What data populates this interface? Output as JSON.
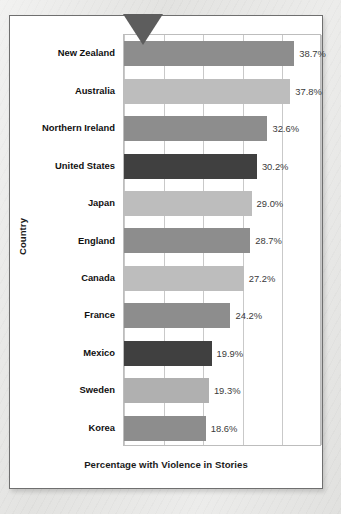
{
  "figure": {
    "pointer_icon": "down-triangle-pointer-icon"
  },
  "chart_data": {
    "type": "bar",
    "orientation": "horizontal",
    "title": "",
    "xlabel": "Percentage with Violence in Stories",
    "ylabel": "Country",
    "categories": [
      "New Zealand",
      "Australia",
      "Northern Ireland",
      "United States",
      "Japan",
      "England",
      "Canada",
      "France",
      "Mexico",
      "Sweden",
      "Korea"
    ],
    "values": [
      38.7,
      37.8,
      32.6,
      30.2,
      29.0,
      28.7,
      27.2,
      24.2,
      19.9,
      19.3,
      18.6
    ],
    "value_labels": [
      "38.7%",
      "37.8%",
      "32.6%",
      "30.2%",
      "29.0%",
      "28.7%",
      "27.2%",
      "24.2%",
      "19.9%",
      "19.3%",
      "18.6%"
    ],
    "bar_colors": [
      "#8d8d8d",
      "#bdbdbd",
      "#8d8d8d",
      "#404040",
      "#bdbdbd",
      "#8d8d8d",
      "#bdbdbd",
      "#8d8d8d",
      "#404040",
      "#b0b0b0",
      "#8d8d8d"
    ],
    "xlim": [
      0,
      45
    ],
    "x_gridline_values": [
      0,
      9,
      18,
      27,
      36,
      45
    ],
    "x_tick_labels": [],
    "grid": true,
    "legend": "none"
  },
  "colors": {
    "page_background": "#e2e2e0",
    "card_background": "#ffffff",
    "card_border": "#6f6f6f",
    "gridline": "#c9c9c9",
    "pointer": "#5d5d5d",
    "axis_title_text": "#1b1b1b",
    "value_text": "#3a3a3a"
  }
}
